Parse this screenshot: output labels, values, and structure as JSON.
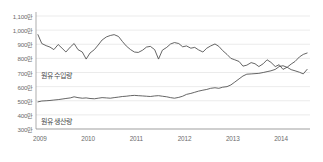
{
  "chart_data": {
    "type": "line",
    "title": "",
    "subtitle": "",
    "xlabel": "",
    "ylabel": "",
    "unit_suffix": "만",
    "grid": true,
    "legend_position": "inline-annotation",
    "ylim": [
      300,
      1100
    ],
    "ytick_values": [
      1100,
      1000,
      900,
      800,
      700,
      600,
      500,
      400,
      300
    ],
    "ytick_labels": [
      "1,100만",
      "1,000만",
      "900만",
      "800만",
      "700만",
      "600만",
      "500만",
      "400만",
      "300만"
    ],
    "xlim": [
      2008.92,
      2014.6
    ],
    "xtick_values": [
      2009,
      2010,
      2011,
      2012,
      2013,
      2014
    ],
    "xtick_labels": [
      "2009",
      "2010",
      "2011",
      "2012",
      "2013",
      "2014"
    ],
    "x": [
      2008.96,
      2009.04,
      2009.13,
      2009.21,
      2009.29,
      2009.38,
      2009.46,
      2009.54,
      2009.63,
      2009.71,
      2009.79,
      2009.88,
      2009.96,
      2010.04,
      2010.13,
      2010.21,
      2010.29,
      2010.38,
      2010.46,
      2010.54,
      2010.63,
      2010.71,
      2010.79,
      2010.88,
      2010.96,
      2011.04,
      2011.13,
      2011.21,
      2011.29,
      2011.38,
      2011.46,
      2011.54,
      2011.63,
      2011.71,
      2011.79,
      2011.88,
      2011.96,
      2012.04,
      2012.13,
      2012.21,
      2012.29,
      2012.38,
      2012.46,
      2012.54,
      2012.63,
      2012.71,
      2012.79,
      2012.88,
      2012.96,
      2013.04,
      2013.13,
      2013.21,
      2013.29,
      2013.38,
      2013.46,
      2013.54,
      2013.63,
      2013.71,
      2013.79,
      2013.88,
      2013.96,
      2014.04,
      2014.13,
      2014.21,
      2014.29,
      2014.38,
      2014.46,
      2014.54
    ],
    "series": [
      {
        "name": "원유 수입량",
        "label": "원유 수입량",
        "color": "#4a4a4a",
        "values": [
          968,
          905,
          890,
          880,
          862,
          898,
          872,
          845,
          880,
          905,
          862,
          845,
          795,
          838,
          862,
          895,
          930,
          952,
          962,
          968,
          955,
          920,
          888,
          862,
          845,
          842,
          858,
          880,
          885,
          862,
          795,
          858,
          878,
          902,
          912,
          905,
          882,
          888,
          872,
          878,
          860,
          845,
          872,
          888,
          902,
          885,
          855,
          828,
          800,
          790,
          778,
          745,
          752,
          770,
          762,
          742,
          762,
          790,
          772,
          742,
          755,
          722,
          738,
          760,
          778,
          810,
          828,
          838
        ]
      },
      {
        "name": "원유 생산량",
        "label": "원유 생산량",
        "color": "#4a4a4a",
        "values": [
          492,
          498,
          500,
          502,
          505,
          508,
          512,
          516,
          520,
          528,
          522,
          518,
          520,
          516,
          514,
          518,
          522,
          520,
          518,
          522,
          526,
          530,
          532,
          536,
          538,
          536,
          534,
          532,
          530,
          534,
          536,
          532,
          528,
          522,
          518,
          524,
          532,
          545,
          552,
          560,
          568,
          575,
          580,
          588,
          592,
          588,
          596,
          600,
          612,
          632,
          655,
          675,
          688,
          690,
          692,
          694,
          700,
          706,
          712,
          722,
          742,
          748,
          736,
          720,
          712,
          702,
          690,
          722
        ]
      }
    ]
  }
}
